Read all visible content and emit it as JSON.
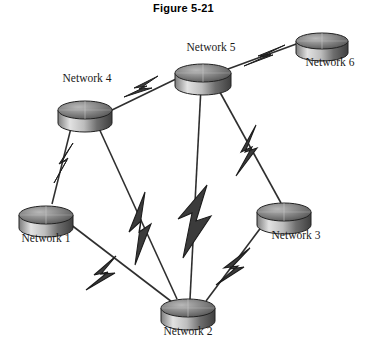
{
  "figure": {
    "title": "Figure 5-21",
    "kind": "network-topology-diagram"
  },
  "palette": {
    "background": "#ffffff",
    "title_color": "#000000",
    "label_color": "#1a1a1a",
    "bolt_fill": "#3b3b3b",
    "bolt_stroke": "#1c1c1c",
    "line_color": "#2f2f2f",
    "node_top_dark": "#5a5a5a",
    "node_top_light": "#c9c9c9",
    "node_body_light": "#d8d8d8",
    "node_body_dark": "#4a4a4a",
    "node_outline": "#222222"
  },
  "nodes": [
    {
      "id": "network-1",
      "label": "Network 1",
      "cx": 46,
      "cy": 215,
      "rx": 27,
      "ry": 9,
      "h": 13,
      "label_x": 46,
      "label_y": 232,
      "label_pos": "below"
    },
    {
      "id": "network-2",
      "label": "Network 2",
      "cx": 188,
      "cy": 308,
      "rx": 27,
      "ry": 9,
      "h": 13,
      "label_x": 188,
      "label_y": 325,
      "label_pos": "below"
    },
    {
      "id": "network-3",
      "label": "Network 3",
      "cx": 284,
      "cy": 212,
      "rx": 27,
      "ry": 9,
      "h": 13,
      "label_x": 296,
      "label_y": 229,
      "label_pos": "below"
    },
    {
      "id": "network-4",
      "label": "Network 4",
      "cx": 85,
      "cy": 110,
      "rx": 27,
      "ry": 9,
      "h": 13,
      "label_x": 87,
      "label_y": 84,
      "label_pos": "above"
    },
    {
      "id": "network-5",
      "label": "Network 5",
      "cx": 203,
      "cy": 73,
      "rx": 28,
      "ry": 9,
      "h": 13,
      "label_x": 211,
      "label_y": 51,
      "label_pos": "above"
    },
    {
      "id": "network-6",
      "label": "Network 6",
      "cx": 322,
      "cy": 41,
      "rx": 26,
      "ry": 8,
      "h": 12,
      "label_x": 330,
      "label_y": 64,
      "label_pos": "below"
    }
  ],
  "links": [
    {
      "id": "link-4-5",
      "from": "network-4",
      "to": "network-5",
      "style": "lightning"
    },
    {
      "id": "link-5-6",
      "from": "network-5",
      "to": "network-6",
      "style": "lightning"
    },
    {
      "id": "link-4-1",
      "from": "network-4",
      "to": "network-1",
      "style": "lightning"
    },
    {
      "id": "link-4-2",
      "from": "network-4",
      "to": "network-2",
      "style": "lightning"
    },
    {
      "id": "link-5-2",
      "from": "network-5",
      "to": "network-2",
      "style": "lightning"
    },
    {
      "id": "link-5-3",
      "from": "network-5",
      "to": "network-3",
      "style": "lightning"
    },
    {
      "id": "link-1-2",
      "from": "network-1",
      "to": "network-2",
      "style": "lightning"
    },
    {
      "id": "link-3-2",
      "from": "network-3",
      "to": "network-2",
      "style": "lightning"
    }
  ]
}
